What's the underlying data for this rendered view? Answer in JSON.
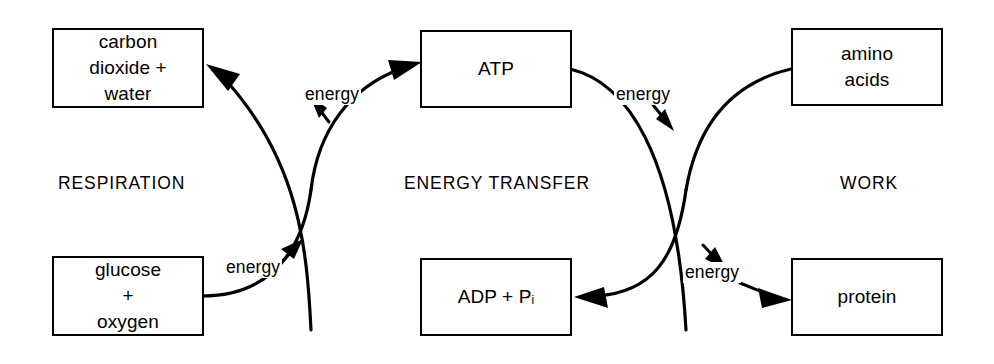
{
  "diagram": {
    "stroke_color": "#000000",
    "background_color": "#ffffff",
    "sections": [
      {
        "id": "respiration",
        "label": "RESPIRATION"
      },
      {
        "id": "energy-transfer",
        "label": "ENERGY TRANSFER"
      },
      {
        "id": "work",
        "label": "WORK"
      }
    ],
    "boxes": [
      {
        "id": "carbon-dioxide-water",
        "label": "carbon\ndioxide +\nwater"
      },
      {
        "id": "atp",
        "label": "ATP"
      },
      {
        "id": "amino-acids",
        "label": "amino\nacids"
      },
      {
        "id": "glucose-oxygen",
        "label": "glucose\n+\noxygen"
      },
      {
        "id": "adp-pi",
        "label_main": "ADP + P",
        "label_subscript": "i"
      },
      {
        "id": "protein",
        "label": "protein"
      }
    ],
    "energy_labels": [
      {
        "id": "energy-respiration-to-atp",
        "label": "energy"
      },
      {
        "id": "energy-glucose-release",
        "label": "energy"
      },
      {
        "id": "energy-atp-to-work",
        "label": "energy"
      },
      {
        "id": "energy-work-output",
        "label": "energy"
      }
    ],
    "arrows": [
      {
        "id": "arrow-to-carbon-dioxide",
        "from": "energy-transfer-left-crossing",
        "to": "carbon-dioxide-water"
      },
      {
        "id": "arrow-to-atp",
        "from": "glucose-oxygen",
        "to": "atp"
      },
      {
        "id": "arrow-to-adp",
        "from": "amino-acids",
        "to": "adp-pi"
      },
      {
        "id": "arrow-to-protein",
        "from": "atp",
        "to": "protein"
      },
      {
        "id": "tick-energy-respiration-to-atp",
        "to": "left-crossing"
      },
      {
        "id": "tick-energy-glucose-release",
        "to": "left-crossing"
      },
      {
        "id": "tick-energy-atp-to-work",
        "to": "right-crossing"
      },
      {
        "id": "tick-energy-work-output",
        "to": "protein"
      }
    ]
  }
}
